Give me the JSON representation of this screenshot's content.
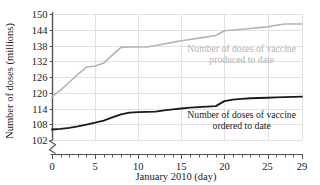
{
  "chart_data": {
    "type": "line",
    "title": "",
    "subtitle": "",
    "xlabel": "January 2010 (day)",
    "ylabel": "Number of doses (millions)",
    "xlim": [
      0,
      29
    ],
    "ylim": [
      102,
      150
    ],
    "y_axis_break": true,
    "y_axis_break_symbol": "zigzag",
    "grid": true,
    "grid_color": "#d9d9d9",
    "legend_position": "inline-annotation",
    "x_ticks_major": [
      0,
      5,
      10,
      15,
      20,
      25,
      29
    ],
    "x_tick_labels": [
      "0",
      "5",
      "10",
      "15",
      "20",
      "25",
      "29"
    ],
    "x_ticks_minor_step": 1,
    "y_ticks": [
      102,
      108,
      114,
      120,
      126,
      132,
      138,
      144,
      150
    ],
    "y_tick_labels": [
      "102",
      "108",
      "114",
      "120",
      "126",
      "132",
      "138",
      "144",
      "150"
    ],
    "x": [
      0,
      1,
      2,
      3,
      4,
      5,
      6,
      7,
      8,
      9,
      10,
      11,
      12,
      13,
      14,
      15,
      16,
      17,
      18,
      19,
      20,
      21,
      22,
      23,
      24,
      25,
      26,
      27,
      28,
      29
    ],
    "series": [
      {
        "name": "Number of doses of vaccine produced to date",
        "color": "#b4b4b4",
        "line_width": 1.6,
        "values": [
          118.5,
          121.0,
          124.0,
          127.0,
          129.8,
          130.2,
          131.3,
          134.3,
          137.3,
          137.4,
          137.4,
          137.4,
          138.0,
          138.6,
          139.2,
          139.8,
          140.3,
          140.8,
          141.3,
          141.8,
          143.6,
          143.9,
          144.2,
          144.5,
          144.8,
          145.1,
          145.7,
          146.2,
          146.2,
          146.2
        ]
      },
      {
        "name": "Number of doses of vaccine ordered to date",
        "color": "#1a1a1a",
        "line_width": 1.8,
        "values": [
          106.0,
          106.2,
          106.6,
          107.2,
          107.9,
          108.6,
          109.4,
          110.6,
          111.8,
          112.4,
          112.6,
          112.7,
          112.8,
          113.3,
          113.7,
          114.0,
          114.3,
          114.5,
          114.7,
          114.9,
          116.8,
          117.4,
          117.7,
          117.9,
          118.0,
          118.1,
          118.2,
          118.3,
          118.4,
          118.5
        ]
      }
    ],
    "annotations": [
      {
        "text_line1": "Number of doses of vaccine",
        "text_line2": "produced to date",
        "color": "#b4b4b4",
        "at_x": 22.0,
        "at_y": 135.5
      },
      {
        "text_line1": "Number of doses of vaccine",
        "text_line2": "ordered to date",
        "color": "#1a1a1a",
        "at_x": 22.0,
        "at_y": 110.5
      }
    ]
  }
}
